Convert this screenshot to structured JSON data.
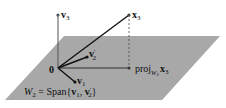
{
  "diagram": {
    "plane_color": "#a6a6a6",
    "origin_label": "0",
    "v3_label": {
      "base": "v",
      "sub": "3"
    },
    "x3_label": {
      "base": "x",
      "sub": "3"
    },
    "v2p_label": {
      "base": "v",
      "sup": "′",
      "sub": "2"
    },
    "v1_label": {
      "base": "v",
      "sub": "1"
    },
    "proj_label": {
      "prefix": "proj",
      "sub": "W",
      "subsub": "2",
      "vec": "x",
      "vecsub": "3"
    },
    "span_label": {
      "lhs": "W",
      "lhs_sub": "2",
      "eq": " = Span{",
      "v1": "v",
      "v1sub": "1",
      "comma": ", ",
      "v2": "v",
      "v2sup": "′",
      "v2sub": "2",
      "close": "}"
    }
  }
}
